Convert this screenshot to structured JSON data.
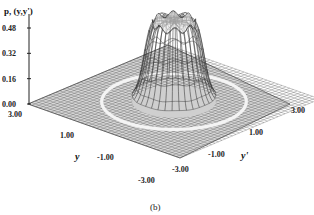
{
  "chart_data": {
    "type": "surface3d",
    "title": "",
    "caption": "(b)",
    "zlabel": "p, (y,y')",
    "xlabel": "y",
    "ylabel": "y'",
    "zticks": [
      "0.00",
      "0.16",
      "0.32",
      "0.48"
    ],
    "zlim": [
      0,
      0.48
    ],
    "xticks": [
      "-3.00",
      "1.00",
      "-1.00",
      "-3.00"
    ],
    "x_tick_values": [
      3,
      1,
      -1,
      -3
    ],
    "x_tick_labels_shown": [
      "3.00",
      "1.00",
      "-1.00",
      "-3.00"
    ],
    "yticks_shown": [
      "-3.00",
      "-1.00",
      "1.00",
      "3.00"
    ],
    "y_tick_values": [
      -3,
      -1,
      1,
      3
    ],
    "xlim": [
      -3,
      3
    ],
    "ylim": [
      -3,
      3
    ],
    "surface": {
      "description": "Flat-topped, steep-sided peak centered at origin with slightly crenellated rim; base plane near zero with a faint ring around the peak",
      "peak_height": 0.5,
      "peak_radius": 0.9,
      "ring_radius": 2.1
    },
    "colors": {
      "mesh": "#333333",
      "ink": "#111111",
      "background": "#ffffff"
    }
  }
}
